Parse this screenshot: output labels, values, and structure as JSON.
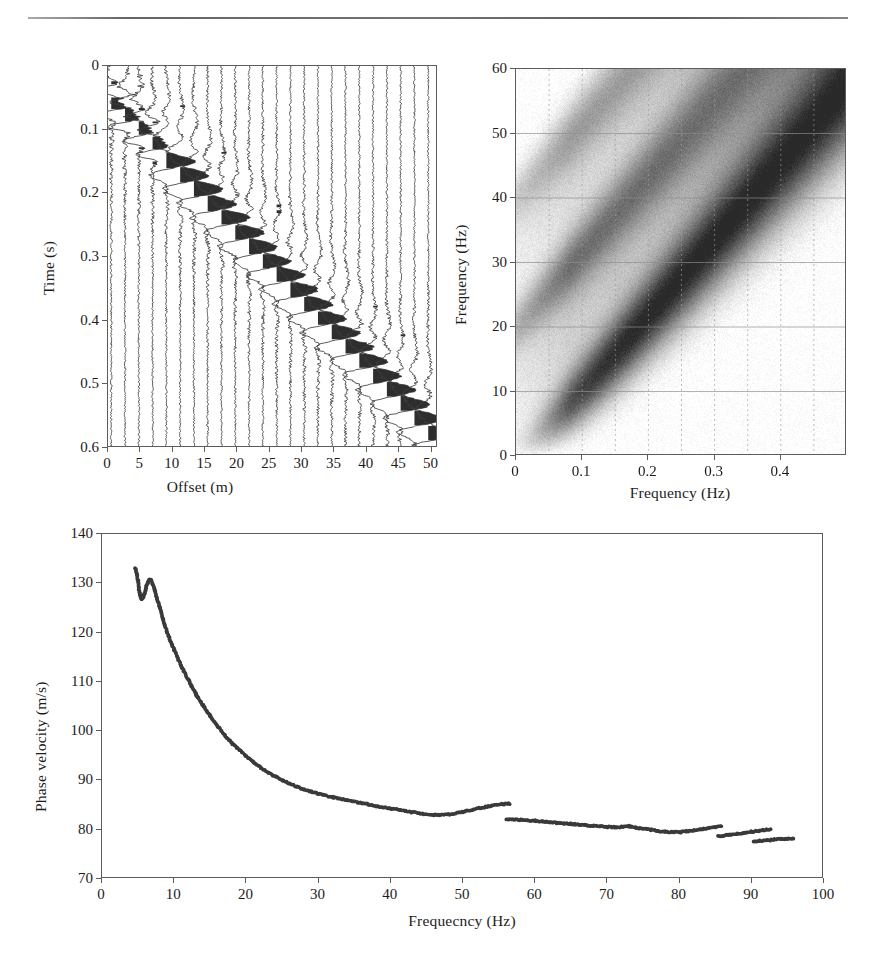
{
  "figure": {
    "kind": "multi-panel-seismic-figure",
    "panel_count": 3,
    "background": "#ffffff",
    "ink_color": "#1c1c1c"
  },
  "panels": {
    "shot_gather": {
      "name": "Shot gather (variable-area wiggle traces)",
      "xlabel": "Offset (m)",
      "ylabel": "Time (s)",
      "xticks": [
        "0",
        "5",
        "10",
        "15",
        "20",
        "25",
        "30",
        "35",
        "40",
        "45",
        "50"
      ],
      "yticks": [
        "0",
        "0.1",
        "0.2",
        "0.3",
        "0.4",
        "0.5",
        "0.6"
      ]
    },
    "fk_spectrum": {
      "name": "Frequency-wavenumber amplitude spectrum",
      "xlabel": "Frequency (Hz)",
      "ylabel": "Frequency (Hz)",
      "xticks": [
        "0",
        "0.1",
        "0.2",
        "0.3",
        "0.4"
      ],
      "yticks": [
        "0",
        "10",
        "20",
        "30",
        "40",
        "50",
        "60"
      ]
    },
    "dispersion": {
      "name": "Dispersion curve",
      "xlabel": "Frequecncy (Hz)",
      "ylabel": "Phase velocity (m/s)",
      "xticks": [
        "0",
        "10",
        "20",
        "30",
        "40",
        "50",
        "60",
        "70",
        "80",
        "90",
        "100"
      ],
      "yticks": [
        "70",
        "80",
        "90",
        "100",
        "110",
        "120",
        "130",
        "140"
      ]
    }
  },
  "chart_data": [
    {
      "type": "line",
      "id": "shot-gather",
      "title": "",
      "xlabel": "Offset (m)",
      "ylabel": "Time (s)",
      "xlim": [
        0,
        51
      ],
      "ylim": [
        0,
        0.6
      ],
      "y_inverted": true,
      "xticks": [
        0,
        5,
        10,
        15,
        20,
        25,
        30,
        35,
        40,
        45,
        50
      ],
      "yticks": [
        0,
        0.1,
        0.2,
        0.3,
        0.4,
        0.5,
        0.6
      ],
      "grid": false,
      "legend": "none",
      "trace_count": 24,
      "trace_spacing_m": 2.13,
      "first_trace_offset_m": 0.5,
      "note": "Variable-area wiggle display; positive lobes filled black. Arrival time of the surface-wave packet increases linearly with offset (moveout ~ 85 m/s apparent).",
      "arrival_times_s": [
        0.05,
        0.068,
        0.09,
        0.112,
        0.133,
        0.155,
        0.177,
        0.2,
        0.222,
        0.245,
        0.268,
        0.29,
        0.312,
        0.335,
        0.358,
        0.38,
        0.403,
        0.425,
        0.447,
        0.47,
        0.492,
        0.515,
        0.537,
        0.56
      ]
    },
    {
      "type": "heatmap",
      "id": "fk-spectrum",
      "title": "",
      "xlabel": "Frequency (Hz)",
      "ylabel": "Frequency (Hz)",
      "xlim": [
        0,
        0.5
      ],
      "ylim": [
        0,
        60
      ],
      "xticks": [
        0,
        0.1,
        0.2,
        0.3,
        0.4
      ],
      "yticks": [
        0,
        10,
        20,
        30,
        40,
        50,
        60
      ],
      "grid": true,
      "colormap": "grayscale (white = low amplitude, black = high amplitude)",
      "note": "Energy concentrated along repeated diagonal ridges of slope ~ 118 Hz per unit wavenumber; strongest ridge passes through (0.10, 10) and (0.48, 55). Weaker aliased replicas appear above and to the left.",
      "ridges": [
        {
          "intercept_hz": -2,
          "slope": 118,
          "strength": 1.0
        },
        {
          "intercept_hz": 20,
          "slope": 118,
          "strength": 0.6
        },
        {
          "intercept_hz": 40,
          "slope": 118,
          "strength": 0.4
        }
      ]
    },
    {
      "type": "scatter",
      "id": "dispersion-curve",
      "title": "",
      "xlabel": "Frequecncy (Hz)",
      "ylabel": "Phase velocity (m/s)",
      "xlim": [
        0,
        100
      ],
      "ylim": [
        70,
        140
      ],
      "xticks": [
        0,
        10,
        20,
        30,
        40,
        50,
        60,
        70,
        80,
        90,
        100
      ],
      "yticks": [
        70,
        80,
        90,
        100,
        110,
        120,
        130,
        140
      ],
      "grid": false,
      "legend": "none",
      "marker": "filled circle",
      "marker_color": "#3a3a3a",
      "segments": [
        {
          "name": "fundamental-mode-low-frequency",
          "x": [
            4.6,
            4.8,
            5.0,
            5.1,
            5.2,
            5.3,
            5.4,
            5.5,
            5.6,
            5.8,
            6.0,
            6.2,
            6.4,
            6.6,
            6.8,
            7.0,
            7.3,
            7.6,
            8.0,
            8.5,
            9.0,
            9.5,
            10.0,
            11.0,
            12.0,
            13.0,
            14.0,
            15.0,
            16.0,
            17.0,
            18.0,
            19.0,
            20.0,
            21.0,
            22.0,
            23.0,
            24.0,
            25.0,
            26.0,
            27.0,
            28.0,
            29.0,
            30.0,
            32.0,
            34.0,
            36.0,
            38.0,
            40.0,
            42.0,
            44.0,
            46.0,
            48.0,
            50.0,
            52.0,
            54.0,
            55.5,
            56.5
          ],
          "y": [
            133.0,
            132.0,
            130.5,
            129.0,
            128.0,
            127.5,
            127.0,
            126.8,
            127.0,
            127.5,
            128.5,
            129.6,
            130.3,
            130.7,
            130.6,
            130.0,
            128.8,
            127.2,
            125.0,
            122.5,
            120.2,
            118.2,
            116.4,
            113.2,
            110.3,
            107.6,
            105.2,
            103.0,
            101.0,
            99.2,
            97.6,
            96.2,
            94.9,
            93.7,
            92.6,
            91.6,
            90.8,
            90.0,
            89.3,
            88.7,
            88.2,
            87.7,
            87.3,
            86.6,
            86.0,
            85.4,
            84.8,
            84.3,
            83.8,
            83.3,
            83.0,
            83.1,
            83.6,
            84.3,
            84.9,
            85.2,
            85.3
          ]
        },
        {
          "name": "segment-2",
          "x": [
            56.0,
            57.0,
            58.0,
            59.0,
            60.0,
            61.0,
            62.0,
            63.0,
            64.0,
            65.0,
            66.0,
            67.0,
            68.0,
            69.0,
            70.0,
            71.0,
            72.0,
            73.0,
            74.0,
            75.0,
            76.0,
            77.0,
            78.0,
            79.0,
            80.0,
            81.0,
            82.0,
            83.0,
            84.0,
            85.0,
            85.8
          ],
          "y": [
            82.2,
            82.1,
            82.0,
            81.9,
            81.8,
            81.7,
            81.5,
            81.4,
            81.3,
            81.2,
            81.0,
            80.9,
            80.8,
            80.7,
            80.6,
            80.5,
            80.6,
            80.7,
            80.4,
            80.2,
            80.0,
            79.8,
            79.6,
            79.5,
            79.5,
            79.7,
            79.9,
            80.1,
            80.3,
            80.5,
            80.7
          ]
        },
        {
          "name": "segment-3",
          "x": [
            85.3,
            86.0,
            87.0,
            88.0,
            89.0,
            90.0,
            91.0,
            92.0,
            92.6
          ],
          "y": [
            78.7,
            78.8,
            79.0,
            79.2,
            79.4,
            79.6,
            79.8,
            80.0,
            80.1
          ]
        },
        {
          "name": "segment-4",
          "x": [
            90.2,
            91.0,
            92.0,
            93.0,
            94.0,
            95.0,
            95.8
          ],
          "y": [
            77.5,
            77.7,
            77.8,
            78.0,
            78.1,
            78.2,
            78.3
          ]
        }
      ]
    }
  ]
}
